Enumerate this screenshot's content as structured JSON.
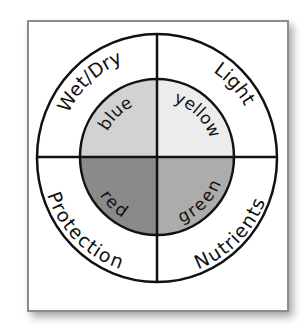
{
  "diagram": {
    "outer_labels": {
      "top_left": "Wet/Dry",
      "top_right": "Light",
      "bottom_left": "Protection",
      "bottom_right": "Nutrients"
    },
    "inner_labels": {
      "top_left": "blue",
      "top_right": "yellow",
      "bottom_left": "red",
      "bottom_right": "green"
    },
    "colors": {
      "blue": "#d2d2d2",
      "yellow": "#ececec",
      "red": "#8a8a8a",
      "green": "#acacac",
      "outline": "#111111",
      "frame": "#8c8c8c"
    }
  }
}
